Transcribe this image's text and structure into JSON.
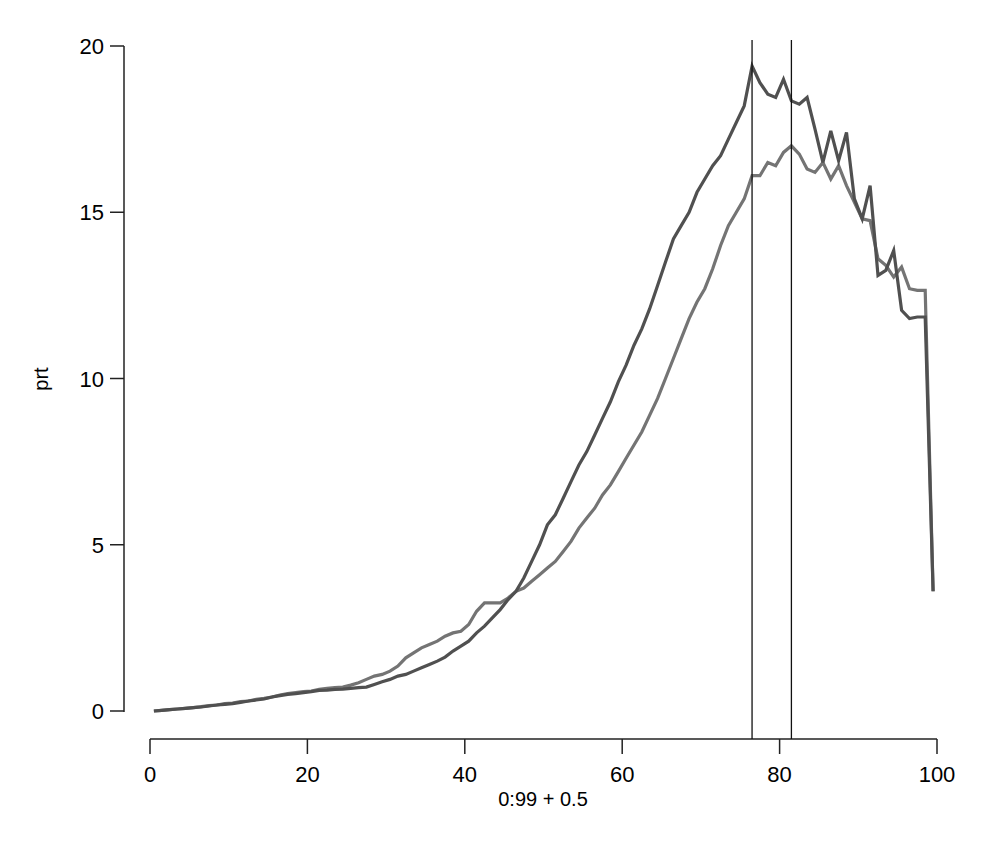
{
  "chart_data": {
    "type": "line",
    "title": "",
    "xlabel": "0:99 + 0.5",
    "ylabel": "prt",
    "xlim": [
      0,
      100
    ],
    "ylim": [
      0,
      20
    ],
    "x_ticks": [
      0,
      20,
      40,
      60,
      80,
      100
    ],
    "y_ticks": [
      0,
      5,
      10,
      15,
      20
    ],
    "grid": false,
    "legend": null,
    "vertical_lines": [
      76.5,
      81.5
    ],
    "x": [
      0.5,
      1.5,
      2.5,
      3.5,
      4.5,
      5.5,
      6.5,
      7.5,
      8.5,
      9.5,
      10.5,
      11.5,
      12.5,
      13.5,
      14.5,
      15.5,
      16.5,
      17.5,
      18.5,
      19.5,
      20.5,
      21.5,
      22.5,
      23.5,
      24.5,
      25.5,
      26.5,
      27.5,
      28.5,
      29.5,
      30.5,
      31.5,
      32.5,
      33.5,
      34.5,
      35.5,
      36.5,
      37.5,
      38.5,
      39.5,
      40.5,
      41.5,
      42.5,
      43.5,
      44.5,
      45.5,
      46.5,
      47.5,
      48.5,
      49.5,
      50.5,
      51.5,
      52.5,
      53.5,
      54.5,
      55.5,
      56.5,
      57.5,
      58.5,
      59.5,
      60.5,
      61.5,
      62.5,
      63.5,
      64.5,
      65.5,
      66.5,
      67.5,
      68.5,
      69.5,
      70.5,
      71.5,
      72.5,
      73.5,
      74.5,
      75.5,
      76.5,
      77.5,
      78.5,
      79.5,
      80.5,
      81.5,
      82.5,
      83.5,
      84.5,
      85.5,
      86.5,
      87.5,
      88.5,
      89.5,
      90.5,
      91.5,
      92.5,
      93.5,
      94.5,
      95.5,
      96.5,
      97.5,
      98.5,
      99.5
    ],
    "series": [
      {
        "name": "series-dark",
        "color": "#505050",
        "values": [
          0.0,
          0.02,
          0.04,
          0.06,
          0.08,
          0.1,
          0.12,
          0.15,
          0.18,
          0.2,
          0.22,
          0.26,
          0.3,
          0.33,
          0.36,
          0.42,
          0.46,
          0.5,
          0.52,
          0.55,
          0.58,
          0.62,
          0.63,
          0.65,
          0.66,
          0.68,
          0.7,
          0.72,
          0.8,
          0.88,
          0.95,
          1.05,
          1.1,
          1.2,
          1.3,
          1.4,
          1.5,
          1.62,
          1.8,
          1.95,
          2.1,
          2.35,
          2.55,
          2.8,
          3.05,
          3.35,
          3.6,
          4.0,
          4.5,
          5.0,
          5.6,
          5.9,
          6.4,
          6.9,
          7.4,
          7.8,
          8.3,
          8.8,
          9.3,
          9.9,
          10.4,
          11.0,
          11.5,
          12.1,
          12.8,
          13.5,
          14.2,
          14.6,
          15.0,
          15.6,
          16.0,
          16.4,
          16.7,
          17.2,
          17.7,
          18.2,
          19.4,
          18.9,
          18.55,
          18.45,
          19.0,
          18.35,
          18.25,
          18.45,
          17.5,
          16.5,
          17.45,
          16.55,
          17.4,
          15.4,
          14.8,
          15.8,
          13.1,
          13.25,
          13.85,
          12.05,
          11.8,
          11.85,
          11.85,
          3.6
        ]
      },
      {
        "name": "series-light",
        "color": "#747474",
        "values": [
          0.0,
          0.02,
          0.04,
          0.06,
          0.08,
          0.1,
          0.13,
          0.16,
          0.18,
          0.22,
          0.24,
          0.28,
          0.3,
          0.35,
          0.38,
          0.42,
          0.48,
          0.52,
          0.55,
          0.58,
          0.6,
          0.65,
          0.68,
          0.7,
          0.72,
          0.78,
          0.85,
          0.95,
          1.05,
          1.1,
          1.2,
          1.35,
          1.6,
          1.75,
          1.9,
          2.0,
          2.1,
          2.25,
          2.35,
          2.4,
          2.6,
          3.0,
          3.25,
          3.25,
          3.25,
          3.4,
          3.6,
          3.7,
          3.9,
          4.1,
          4.3,
          4.5,
          4.8,
          5.1,
          5.5,
          5.8,
          6.1,
          6.5,
          6.8,
          7.2,
          7.6,
          8.0,
          8.4,
          8.9,
          9.4,
          10.0,
          10.6,
          11.2,
          11.8,
          12.3,
          12.7,
          13.3,
          14.0,
          14.6,
          15.0,
          15.4,
          16.1,
          16.1,
          16.5,
          16.4,
          16.8,
          17.0,
          16.75,
          16.3,
          16.2,
          16.5,
          16.0,
          16.4,
          15.8,
          15.3,
          14.8,
          14.75,
          13.6,
          13.4,
          13.05,
          13.35,
          12.7,
          12.65,
          12.65,
          3.6
        ]
      }
    ]
  },
  "labels": {
    "xlabel": "0:99 + 0.5",
    "ylabel": "prt",
    "x_ticks": [
      "0",
      "20",
      "40",
      "60",
      "80",
      "100"
    ],
    "y_ticks": [
      "0",
      "5",
      "10",
      "15",
      "20"
    ]
  }
}
